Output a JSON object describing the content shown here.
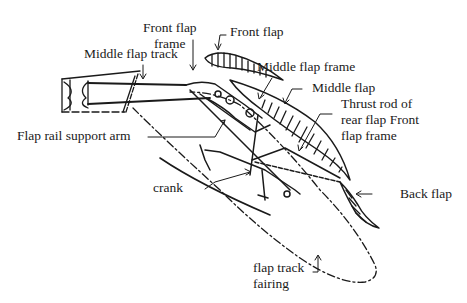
{
  "diagram": {
    "type": "mechanical-cross-section",
    "labels": {
      "front_flap_frame": [
        "Front flap",
        "frame"
      ],
      "front_flap": "Front flap",
      "middle_flap_track": "Middle flap track",
      "middle_flap_frame": "Middle flap frame",
      "middle_flap": "Middle flap",
      "thrust_rod": [
        "Thrust rod of",
        "rear flap Front",
        "flap frame"
      ],
      "flap_rail_support_arm": "Flap rail support arm",
      "crank": "crank",
      "back_flap": "Back flap",
      "flap_track_fairing": [
        "flap track",
        "fairing"
      ]
    },
    "colors": {
      "ink": "#1a1a1a",
      "background": "#ffffff"
    }
  }
}
